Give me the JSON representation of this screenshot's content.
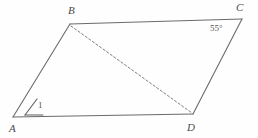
{
  "figure": {
    "shape_type": "parallelogram",
    "background_color": "#fefefe",
    "stroke_color": "#6b6b6b",
    "dashed_stroke_color": "#7d7d7d",
    "label_color": "#4a4a4a"
  },
  "vertices": {
    "A": {
      "label": "A",
      "x": 13,
      "y": 117
    },
    "B": {
      "label": "B",
      "x": 70,
      "y": 24
    },
    "C": {
      "label": "C",
      "x": 242,
      "y": 19
    },
    "D": {
      "label": "D",
      "x": 193,
      "y": 114
    }
  },
  "edges": [
    {
      "name": "AB",
      "from": "A",
      "to": "B",
      "style": "solid"
    },
    {
      "name": "BC",
      "from": "B",
      "to": "C",
      "style": "solid"
    },
    {
      "name": "CD",
      "from": "C",
      "to": "D",
      "style": "solid"
    },
    {
      "name": "DA",
      "from": "D",
      "to": "A",
      "style": "solid"
    },
    {
      "name": "BD",
      "from": "B",
      "to": "D",
      "style": "dashed"
    }
  ],
  "annotations": {
    "angle_at_C": "55°",
    "angle_at_A": "1",
    "angle_symbol": "∠"
  }
}
